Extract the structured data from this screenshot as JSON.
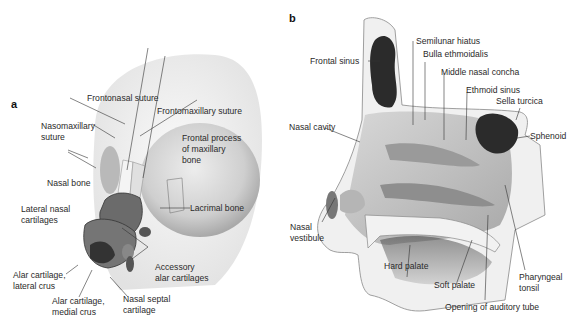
{
  "panels": {
    "a": {
      "letter": "a",
      "labels": {
        "frontonasal_suture": "Frontonasal suture",
        "frontomaxillary_suture": "Frontomaxillary suture",
        "nasomaxillary_suture_1": "Nasomaxillary",
        "nasomaxillary_suture_2": "suture",
        "frontal_process_1": "Frontal process",
        "frontal_process_2": "of maxillary",
        "frontal_process_3": "bone",
        "nasal_bone": "Nasal bone",
        "lateral_nasal_1": "Lateral nasal",
        "lateral_nasal_2": "cartilages",
        "lacrimal_bone": "Lacrimal bone",
        "accessory_1": "Accessory",
        "accessory_2": "alar cartilages",
        "alar_lateral_1": "Alar cartilage,",
        "alar_lateral_2": "lateral crus",
        "alar_medial_1": "Alar cartilage,",
        "alar_medial_2": "medial crus",
        "septal_1": "Nasal septal",
        "septal_2": "cartilage"
      }
    },
    "b": {
      "letter": "b",
      "labels": {
        "frontal_sinus": "Frontal sinus",
        "semilunar_hiatus": "Semilunar hiatus",
        "bulla_ethmoidalis": "Bulla ethmoidalis",
        "middle_nasal_concha": "Middle nasal concha",
        "ethmoid_sinus": "Ethmoid sinus",
        "sella_turcica": "Sella turcica",
        "sphenoid": "Sphenoid",
        "nasal_cavity": "Nasal cavity",
        "nasal_vestibule_1": "Nasal",
        "nasal_vestibule_2": "vestibule",
        "hard_palate": "Hard palate",
        "soft_palate": "Soft palate",
        "pharyngeal_tonsil_1": "Pharyngeal",
        "pharyngeal_tonsil_2": "tonsil",
        "auditory_tube": "Opening of auditory tube"
      }
    }
  },
  "colors": {
    "bone": "#ececec",
    "cartilage": "#6b6b6b",
    "sinus": "#2b2b2b",
    "cavity": "#c9c9c9",
    "line": "#333333"
  }
}
